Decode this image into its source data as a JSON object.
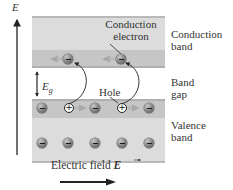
{
  "figure": {
    "axis_label": "E",
    "labels": {
      "conduction_electron": [
        "Conduction",
        "electron"
      ],
      "conduction_band": [
        "Conduction",
        "band"
      ],
      "band_gap": [
        "Band",
        "gap"
      ],
      "valence_band": [
        "Valence",
        "band"
      ],
      "energy_gap": "E",
      "energy_gap_subscript": "g",
      "hole": "Hole",
      "electric_field": "Electric field",
      "electric_field_symbol": "E"
    },
    "hole_symbol": "+",
    "colors": {
      "band_light": "#dcdcdc",
      "band_dark": "#c6c6c6",
      "band_edge": "#b0b0b0",
      "arrow": "#222222",
      "drift_arrow": "#a8a8a8"
    }
  }
}
